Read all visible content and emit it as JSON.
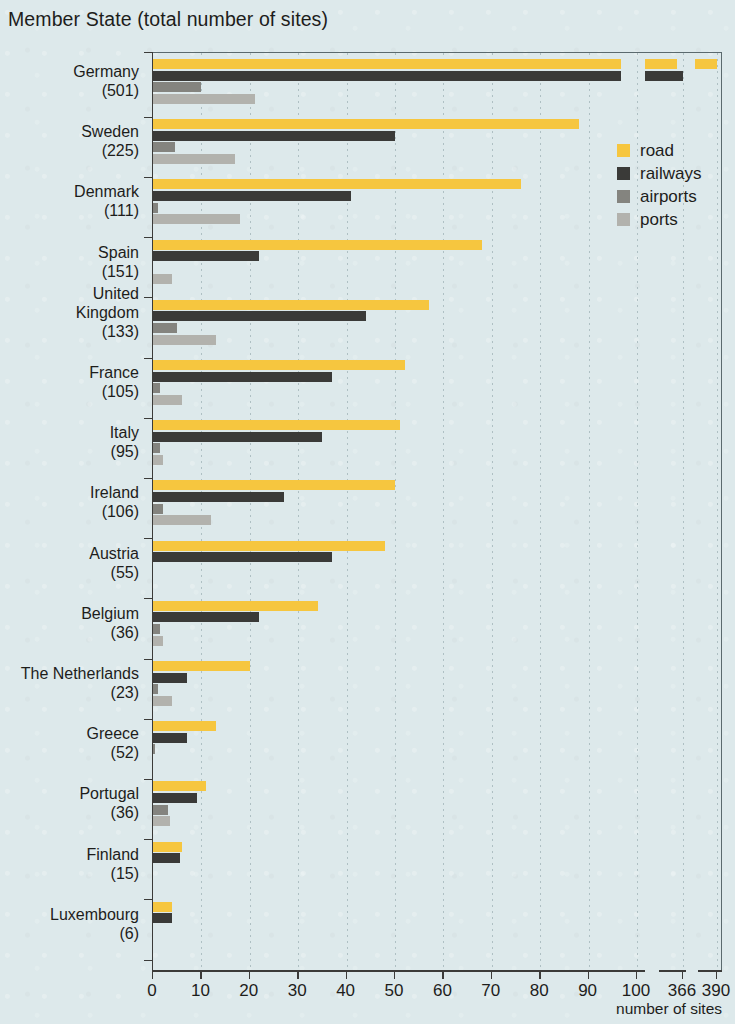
{
  "title": "Member State (total number of sites)",
  "x_caption": "number of sites",
  "legend": [
    {
      "label": "road",
      "color": "#f6c63f"
    },
    {
      "label": "railways",
      "color": "#3a3a38"
    },
    {
      "label": "airports",
      "color": "#84847f"
    },
    {
      "label": "ports",
      "color": "#b2b2ad"
    }
  ],
  "axis": {
    "ticks": [
      "0",
      "10",
      "20",
      "30",
      "40",
      "50",
      "60",
      "70",
      "80",
      "90",
      "100",
      "366",
      "390"
    ],
    "tick_values": [
      0,
      10,
      20,
      30,
      40,
      50,
      60,
      70,
      80,
      90,
      100,
      366,
      390
    ],
    "break_after": 100
  },
  "chart_data": {
    "type": "bar",
    "orientation": "horizontal",
    "title": "Member State (total number of sites)",
    "xlabel": "number of sites",
    "ylabel": "Member State (total number of sites)",
    "xlim": [
      0,
      390
    ],
    "axis_break": {
      "from": 100,
      "to": 366
    },
    "grid": "vertical-dotted",
    "legend_position": "upper-right-inside",
    "categories": [
      "Germany",
      "Sweden",
      "Denmark",
      "Spain",
      "United Kingdom",
      "France",
      "Italy",
      "Ireland",
      "Austria",
      "Belgium",
      "The Netherlands",
      "Greece",
      "Portugal",
      "Finland",
      "Luxembourg"
    ],
    "category_totals": [
      501,
      225,
      111,
      151,
      133,
      105,
      95,
      106,
      55,
      36,
      23,
      52,
      36,
      15,
      6
    ],
    "series": [
      {
        "name": "road",
        "color": "#f6c63f",
        "values": [
          390,
          88,
          76,
          68,
          57,
          52,
          51,
          50,
          48,
          34,
          20,
          13,
          11,
          6,
          4
        ]
      },
      {
        "name": "railways",
        "color": "#3a3a38",
        "values": [
          366,
          50,
          41,
          22,
          44,
          37,
          35,
          27,
          37,
          22,
          7,
          7,
          9,
          5.5,
          4
        ]
      },
      {
        "name": "airports",
        "color": "#84847f",
        "values": [
          10,
          4.5,
          1,
          0,
          5,
          1.5,
          1.5,
          2,
          0,
          1.5,
          1,
          0.5,
          3,
          0,
          0
        ]
      },
      {
        "name": "ports",
        "color": "#b2b2ad",
        "values": [
          21,
          17,
          18,
          4,
          13,
          6,
          2,
          12,
          0,
          2,
          4,
          0,
          3.5,
          0,
          0
        ]
      }
    ]
  }
}
